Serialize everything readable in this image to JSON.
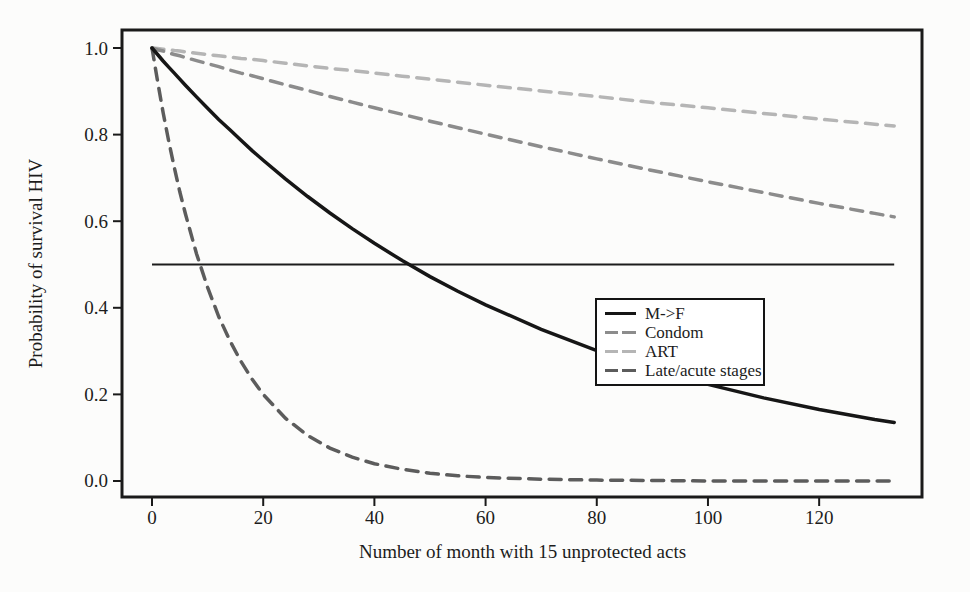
{
  "figure": {
    "background": "#fcfcfb",
    "frame_color": "#1a1a1a"
  },
  "chart_data": {
    "type": "line",
    "title": "",
    "xlabel": "Number of month with 15 unprotected acts",
    "ylabel": "Probability of survival HIV",
    "x_ticks": [
      0,
      20,
      40,
      60,
      80,
      100,
      120
    ],
    "x_tick_labels": [
      "0",
      "20",
      "40",
      "60",
      "80",
      "100",
      "120"
    ],
    "y_ticks": [
      0.0,
      0.2,
      0.4,
      0.6,
      0.8,
      1.0
    ],
    "y_tick_labels": [
      "0.0",
      "0.2",
      "0.4",
      "0.6",
      "0.8",
      "1.0"
    ],
    "xlim": [
      -5.4,
      138.5
    ],
    "ylim": [
      -0.037,
      1.0416
    ],
    "grid": false,
    "legend_position": "center-right",
    "x": [
      0,
      1,
      2,
      3,
      4,
      5,
      6,
      8,
      10,
      12,
      14,
      16,
      18,
      20,
      24,
      28,
      32,
      36,
      40,
      45,
      50,
      55,
      60,
      70,
      80,
      90,
      100,
      110,
      120,
      130,
      133.5
    ],
    "series": [
      {
        "name": "M->F",
        "color": "#161616",
        "style": "solid",
        "values": [
          1,
          0.985,
          0.97,
          0.956,
          0.942,
          0.928,
          0.914,
          0.887,
          0.861,
          0.835,
          0.811,
          0.787,
          0.763,
          0.741,
          0.698,
          0.657,
          0.619,
          0.583,
          0.549,
          0.509,
          0.472,
          0.438,
          0.407,
          0.35,
          0.301,
          0.259,
          0.223,
          0.192,
          0.165,
          0.142,
          0.135
        ]
      },
      {
        "name": "Condom",
        "color": "#8c8c8c",
        "style": "dashed",
        "values": [
          1,
          0.996,
          0.993,
          0.989,
          0.985,
          0.982,
          0.978,
          0.971,
          0.964,
          0.957,
          0.949,
          0.942,
          0.936,
          0.929,
          0.915,
          0.902,
          0.888,
          0.875,
          0.862,
          0.847,
          0.831,
          0.816,
          0.801,
          0.772,
          0.744,
          0.717,
          0.691,
          0.666,
          0.641,
          0.618,
          0.61
        ]
      },
      {
        "name": "ART",
        "color": "#b5b5b5",
        "style": "dashed",
        "values": [
          1,
          0.999,
          0.997,
          0.996,
          0.994,
          0.993,
          0.991,
          0.988,
          0.985,
          0.982,
          0.979,
          0.976,
          0.974,
          0.971,
          0.965,
          0.959,
          0.953,
          0.948,
          0.942,
          0.935,
          0.928,
          0.921,
          0.914,
          0.901,
          0.888,
          0.874,
          0.862,
          0.849,
          0.836,
          0.824,
          0.82
        ]
      },
      {
        "name": "Late/acute stages",
        "color": "#5c5c5c",
        "style": "dashed",
        "values": [
          1,
          0.923,
          0.851,
          0.785,
          0.724,
          0.668,
          0.617,
          0.525,
          0.447,
          0.38,
          0.324,
          0.276,
          0.235,
          0.2,
          0.145,
          0.105,
          0.076,
          0.055,
          0.04,
          0.027,
          0.018,
          0.012,
          0.008,
          0.004,
          0.002,
          0.001,
          0,
          0,
          0,
          0,
          0
        ]
      }
    ],
    "reference_line": {
      "y": 0.5,
      "x_start": 0,
      "x_end": 133.5,
      "color": "#1c1c1c",
      "style": "solid"
    }
  }
}
